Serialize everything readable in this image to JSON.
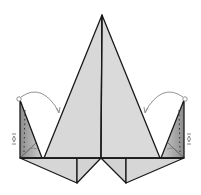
{
  "diagram": {
    "type": "origami-fold-step",
    "colors": {
      "paper": "#d6d6d6",
      "paper_shaded": "#9a9a9a",
      "line": "#1a1a1a",
      "arrow": "#8a8a8a",
      "background": "#ffffff"
    },
    "elements": {
      "center_kite": {
        "apex": [
          102,
          15
        ],
        "base_left": [
          44,
          158
        ],
        "base_right": [
          160,
          158
        ],
        "center_crease": true
      },
      "left_flap": {
        "top": [
          20,
          100
        ],
        "bottom_left": [
          20,
          158
        ],
        "bottom_right": [
          42,
          158
        ],
        "fold_arrow": "valley-fold-to-center"
      },
      "right_flap": {
        "top": [
          184,
          100
        ],
        "bottom_left": [
          161,
          158
        ],
        "bottom_right": [
          184,
          158
        ],
        "fold_arrow": "valley-fold-to-center"
      },
      "base_points": [
        {
          "x": 77,
          "y": 183
        },
        {
          "x": 126,
          "y": 183
        }
      ],
      "symbols": [
        "curved-fold-arrow-left",
        "curved-fold-arrow-right",
        "repeat-arrow-left",
        "repeat-arrow-right",
        "dotted-valley-line-left",
        "dotted-valley-line-right"
      ]
    }
  }
}
